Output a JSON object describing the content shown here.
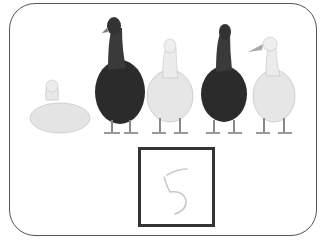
{
  "worksheet": {
    "task": "count-the-ducks",
    "ducks": [
      {
        "color": "white",
        "pose": "sitting"
      },
      {
        "color": "dark",
        "pose": "standing"
      },
      {
        "color": "white",
        "pose": "standing"
      },
      {
        "color": "dark",
        "pose": "standing"
      },
      {
        "color": "white",
        "pose": "standing"
      }
    ],
    "answer": {
      "value": "5",
      "style": "handwritten"
    }
  },
  "colors": {
    "border": "#555555",
    "box_border": "#333333",
    "dark_duck": "#2a2a2a",
    "white_duck": "#e6e6e6"
  }
}
